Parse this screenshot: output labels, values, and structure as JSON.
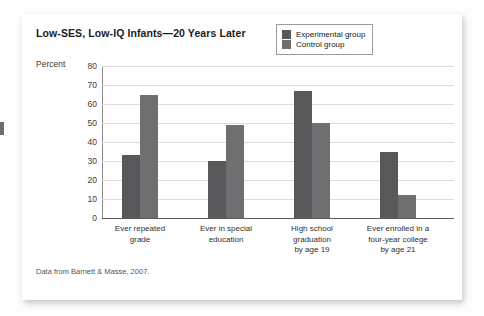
{
  "figure": {
    "title": "Low-SES, Low-IQ Infants—20 Years Later",
    "unit_label": "Percent",
    "source_note": "Data from Barnett & Masse, 2007."
  },
  "legend": {
    "items": [
      {
        "label": "Experimental group",
        "color": "#58585a",
        "swatch_name": "legend-swatch-experimental"
      },
      {
        "label": "Control group",
        "color": "#6f6f71",
        "swatch_name": "legend-swatch-control"
      }
    ]
  },
  "chart_data": {
    "type": "bar",
    "title": "Low-SES, Low-IQ Infants—20 Years Later",
    "xlabel": "",
    "ylabel": "Percent",
    "ylim": [
      0,
      80
    ],
    "yticks": [
      0,
      10,
      20,
      30,
      40,
      50,
      60,
      70,
      80
    ],
    "grid": true,
    "legend_position": "top-right",
    "categories": [
      "Ever repeated grade",
      "Ever in special education",
      "High school graduation by age 19",
      "Ever enrolled in a four-year college by age 21"
    ],
    "category_lines": [
      [
        "Ever repeated",
        "grade"
      ],
      [
        "Ever in special",
        "education"
      ],
      [
        "High school",
        "graduation",
        "by age 19"
      ],
      [
        "Ever enrolled in a",
        "four-year college",
        "by age 21"
      ]
    ],
    "series": [
      {
        "name": "Experimental group",
        "color": "#58585a",
        "values": [
          33,
          30,
          67,
          35
        ]
      },
      {
        "name": "Control group",
        "color": "#6f6f71",
        "values": [
          65,
          49,
          50,
          12
        ]
      }
    ]
  }
}
